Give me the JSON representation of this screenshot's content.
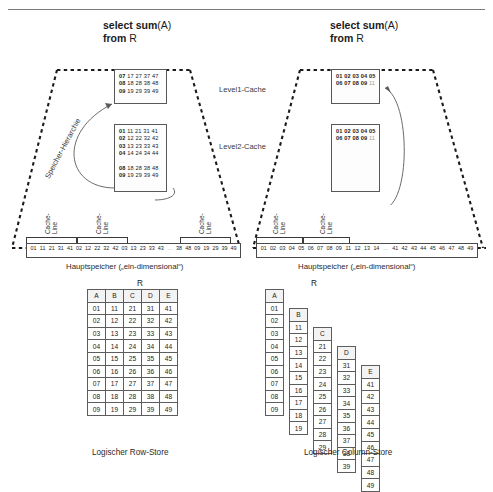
{
  "page": {
    "title_rule": true
  },
  "left_panel": {
    "query": {
      "line1_bold": "select sum",
      "line1_rest": "(A)",
      "line2_bold": "from",
      "line2_rest": " R"
    },
    "hierarchy_label": "Speicher-Hierarchie",
    "l1_cache": {
      "level_label": "Level1-Cache",
      "rows": [
        {
          "key": "07",
          "rest": "17 27 37 47"
        },
        {
          "key": "08",
          "rest": "18 28 38 48"
        },
        {
          "key": "09",
          "rest": "19 29 39 49"
        }
      ]
    },
    "l2_cache": {
      "level_label": "Level2-Cache",
      "rows": [
        {
          "key": "01",
          "rest": "11 21 31 41"
        },
        {
          "key": "02",
          "rest": "12 22 32 42"
        },
        {
          "key": "03",
          "rest": "13 23 33 43"
        },
        {
          "key": "04",
          "rest": "14 24 34 44"
        },
        {
          "key": "...",
          "rest": ""
        },
        {
          "key": "08",
          "rest": "18 28 38 48"
        },
        {
          "key": "09",
          "rest": "19 29 39 49"
        }
      ]
    },
    "cache_line_labels": [
      "Cache-\nLine",
      "Cache-\nLine",
      "Cache-\nLine"
    ],
    "memory": {
      "caption": "Hauptspeicher („ein-dimensional“)",
      "cells": [
        "01",
        "11",
        "21",
        "31",
        "41",
        "02",
        "12",
        "22",
        "32",
        "42",
        "03",
        "13",
        "23",
        "33",
        "43",
        "…",
        "38",
        "48",
        "09",
        "19",
        "29",
        "39",
        "49"
      ]
    }
  },
  "right_panel": {
    "query": {
      "line1_bold": "select sum",
      "line1_rest": "(A)",
      "line2_bold": "from",
      "line2_rest": " R"
    },
    "l1_cache": {
      "rows": [
        {
          "vals": "01 02 03 04 05",
          "dim": ""
        },
        {
          "vals": "06 07 08 09",
          "dim": " 11"
        }
      ]
    },
    "l2_cache": {
      "rows": [
        {
          "vals": "01 02 03 04 05",
          "dim": ""
        },
        {
          "vals": "06 07 08 09",
          "dim": " 11"
        }
      ]
    },
    "cache_line_labels": [
      "Cache-\nLine",
      "Cache-\nLine"
    ],
    "memory": {
      "caption": "Hauptspeicher („ein-dimensional“)",
      "cells": [
        "01",
        "02",
        "03",
        "04",
        "05",
        "06",
        "07",
        "08",
        "09",
        "11",
        "12",
        "13",
        "14",
        "…",
        "41",
        "42",
        "43",
        "44",
        "45",
        "46",
        "47",
        "48",
        "49"
      ]
    }
  },
  "row_store": {
    "relation": "R",
    "caption": "Logischer Row-Store",
    "headers": [
      "A",
      "B",
      "C",
      "D",
      "E"
    ],
    "rows": [
      [
        "01",
        "11",
        "21",
        "31",
        "41"
      ],
      [
        "02",
        "12",
        "22",
        "32",
        "42"
      ],
      [
        "03",
        "13",
        "23",
        "33",
        "43"
      ],
      [
        "04",
        "14",
        "24",
        "34",
        "44"
      ],
      [
        "05",
        "15",
        "25",
        "35",
        "45"
      ],
      [
        "06",
        "16",
        "26",
        "36",
        "46"
      ],
      [
        "07",
        "17",
        "27",
        "37",
        "47"
      ],
      [
        "08",
        "18",
        "28",
        "38",
        "48"
      ],
      [
        "09",
        "19",
        "29",
        "39",
        "49"
      ]
    ]
  },
  "column_store": {
    "relation": "R",
    "caption": "Logischer Column-Store",
    "columns": [
      {
        "header": "A",
        "values": [
          "01",
          "02",
          "03",
          "04",
          "05",
          "06",
          "07",
          "08",
          "09"
        ]
      },
      {
        "header": "B",
        "values": [
          "11",
          "12",
          "13",
          "14",
          "15",
          "16",
          "17",
          "18",
          "19"
        ]
      },
      {
        "header": "C",
        "values": [
          "21",
          "22",
          "23",
          "24",
          "25",
          "26",
          "27",
          "28",
          "29"
        ]
      },
      {
        "header": "D",
        "values": [
          "31",
          "32",
          "33",
          "34",
          "35",
          "36",
          "37",
          "38",
          "39"
        ]
      },
      {
        "header": "E",
        "values": [
          "41",
          "42",
          "43",
          "44",
          "45",
          "46",
          "47",
          "48",
          "49"
        ]
      }
    ]
  },
  "colors": {
    "ink": "#1b1b1b",
    "line": "#5d5d5d",
    "dim": "#9a9a9a",
    "arrow": "#5a5a5a"
  }
}
